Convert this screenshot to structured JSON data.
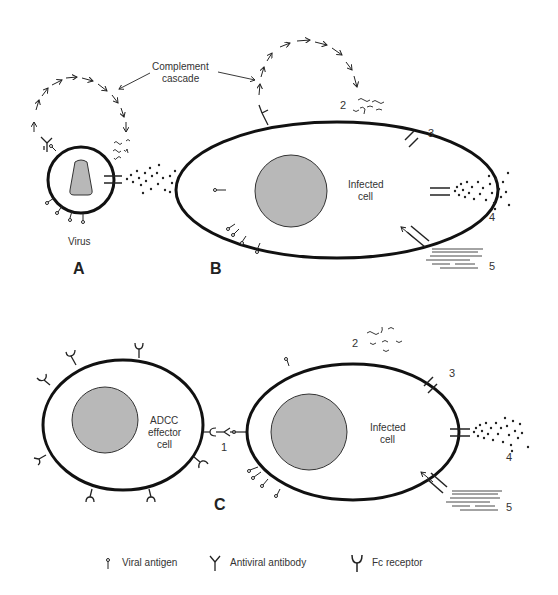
{
  "labels": {
    "complement_line1": "Complement",
    "complement_line2": "cascade",
    "virus": "Virus",
    "infected_b_line1": "Infected",
    "infected_b_line2": "cell",
    "infected_c_line1": "Infected",
    "infected_c_line2": "cell",
    "adcc_line1": "ADCC",
    "adcc_line2": "effector",
    "adcc_line3": "cell",
    "panel_a": "A",
    "panel_b": "B",
    "panel_c": "C",
    "num_1": "1",
    "num_2b": "2",
    "num_3b": "3",
    "num_4b": "4",
    "num_5b": "5",
    "num_2c": "2",
    "num_3c": "3",
    "num_4c": "4",
    "num_5c": "5"
  },
  "legend": [
    {
      "icon": "viral-antigen-icon",
      "label": "Viral antigen"
    },
    {
      "icon": "antiviral-antibody-icon",
      "label": "Antiviral antibody"
    },
    {
      "icon": "fc-receptor-icon",
      "label": "Fc receptor"
    }
  ],
  "colors": {
    "stroke": "#1a1a1a",
    "nucleus_fill": "#b8b8b8",
    "text": "#333333"
  }
}
